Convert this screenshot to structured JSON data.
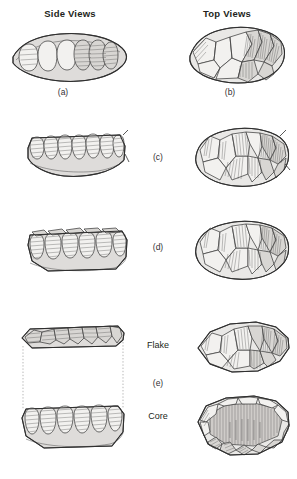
{
  "headers": {
    "side": "Side Views",
    "top": "Top Views"
  },
  "captions": {
    "a": "(a)",
    "b": "(b)",
    "c": "(c)",
    "d": "(d)",
    "e": "(e)",
    "flake": "Flake",
    "core": "Core"
  },
  "colors": {
    "ink": "#231f20",
    "stone_fill": "#dedcda",
    "scar_fill": "#f2f1ef",
    "hatch": "#3d3d3d",
    "dotted_guide": "#9a9a9a",
    "background": "#ffffff"
  },
  "figures": [
    {
      "id": "a",
      "view": "side",
      "label": "(a)",
      "description": "Lenticular biconvex nodule in side profile with scalloped flake scars along upper margin"
    },
    {
      "id": "b",
      "view": "top",
      "label": "(b)",
      "description": "Top view of nodule with radial flake scars converging toward the center"
    },
    {
      "id": "c",
      "view": "side",
      "label": "(c)",
      "description": "Side view with flattened base and steep hatched flake scars on the upper half"
    },
    {
      "id": "c-top",
      "view": "top",
      "label": "(c)",
      "description": "Top view showing centripetal preparation flake scars around the perimeter"
    },
    {
      "id": "d",
      "view": "side",
      "label": "(d)",
      "description": "Side view of prepared core with flat striking platform and faceted edge"
    },
    {
      "id": "d-top",
      "view": "top",
      "label": "(d)",
      "description": "Top view of prepared Levallois core surface"
    },
    {
      "id": "e-flake-side",
      "view": "side",
      "label": "Flake",
      "description": "Thin detached flake shown in side profile above the core"
    },
    {
      "id": "e-core-side",
      "view": "side",
      "label": "Core",
      "description": "Core in side profile after flake removal"
    },
    {
      "id": "e-flake-top",
      "view": "top",
      "label": "Flake",
      "description": "Top view of the detached Levallois flake with dorsal scars"
    },
    {
      "id": "e-core-top",
      "view": "top",
      "label": "Core",
      "description": "Top view of the core with the negative flake scar hatched at center"
    }
  ]
}
